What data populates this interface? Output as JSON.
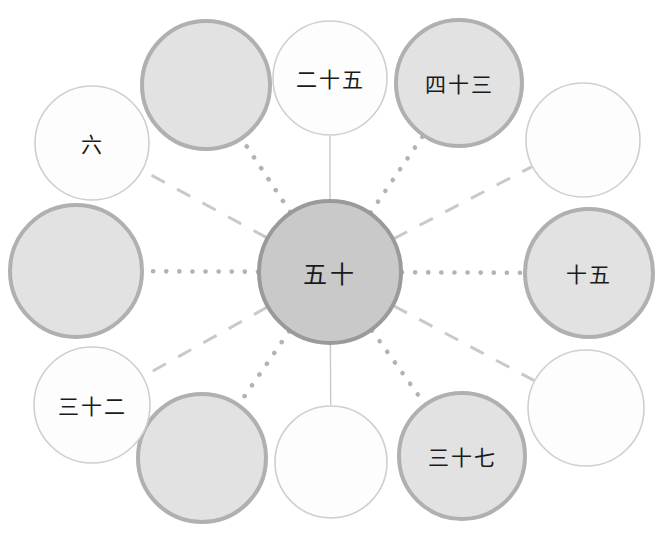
{
  "diagram": {
    "type": "radial-hub-and-spoke",
    "canvas": {
      "width": 664,
      "height": 538
    },
    "center": {
      "id": "center",
      "label": "五十",
      "value": 50,
      "cx": 330,
      "cy": 272,
      "r": 71,
      "fill": "#c9c9c9",
      "stroke": "#9a9a9a",
      "stroke_width": 4
    },
    "colors": {
      "filled_node_fill": "#e2e2e2",
      "filled_node_stroke": "#b0b0b0",
      "empty_node_fill": "#fdfdfd",
      "empty_node_stroke": "#cfcfcf",
      "center_fill": "#c9c9c9",
      "center_stroke": "#9a9a9a",
      "connector_dotted": "#b3b3b3",
      "connector_dashed": "#c9c9c9",
      "connector_solid": "#c9c9c9",
      "text": "#1a1a1a"
    },
    "nodes": [
      {
        "id": "node-top",
        "label": "二十五",
        "value": 25,
        "cx": 330,
        "cy": 78,
        "r": 57,
        "style": "outline",
        "connector": "solid"
      },
      {
        "id": "node-upper-right-inner",
        "label": "四十三",
        "value": 43,
        "cx": 459,
        "cy": 83,
        "r": 63,
        "style": "filled",
        "connector": "dotted"
      },
      {
        "id": "node-upper-right-outer",
        "label": "",
        "value": null,
        "cx": 583,
        "cy": 140,
        "r": 57,
        "style": "outline",
        "connector": "dashed"
      },
      {
        "id": "node-right",
        "label": "十五",
        "value": 15,
        "cx": 589,
        "cy": 273,
        "r": 64,
        "style": "filled",
        "connector": "dotted"
      },
      {
        "id": "node-lower-right-outer",
        "label": "",
        "value": null,
        "cx": 586,
        "cy": 408,
        "r": 58,
        "style": "outline",
        "connector": "dashed"
      },
      {
        "id": "node-lower-right-inner",
        "label": "三十七",
        "value": 37,
        "cx": 462,
        "cy": 456,
        "r": 63,
        "style": "filled",
        "connector": "dotted"
      },
      {
        "id": "node-bottom",
        "label": "",
        "value": null,
        "cx": 331,
        "cy": 462,
        "r": 56,
        "style": "outline",
        "connector": "solid"
      },
      {
        "id": "node-lower-left-inner",
        "label": "",
        "value": null,
        "cx": 202,
        "cy": 458,
        "r": 64,
        "style": "filled",
        "connector": "dotted"
      },
      {
        "id": "node-lower-left-outer",
        "label": "三十二",
        "value": 32,
        "cx": 92,
        "cy": 405,
        "r": 58,
        "style": "outline",
        "connector": "dashed"
      },
      {
        "id": "node-left",
        "label": "",
        "value": null,
        "cx": 76,
        "cy": 271,
        "r": 66,
        "style": "filled",
        "connector": "dotted"
      },
      {
        "id": "node-upper-left-outer",
        "label": "六",
        "value": 6,
        "cx": 92,
        "cy": 143,
        "r": 57,
        "style": "outline",
        "connector": "dashed"
      },
      {
        "id": "node-upper-left-inner",
        "label": "",
        "value": null,
        "cx": 206,
        "cy": 85,
        "r": 64,
        "style": "filled",
        "connector": "dotted"
      }
    ]
  }
}
